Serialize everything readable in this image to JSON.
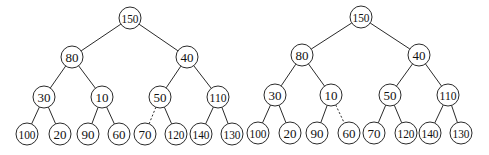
{
  "diagram": {
    "type": "binary-tree-pair",
    "node_radius": 11,
    "trees": [
      {
        "id": "left-tree",
        "nodes": [
          {
            "id": "L0",
            "label": "150",
            "x": 130,
            "y": 18
          },
          {
            "id": "L1",
            "label": "80",
            "x": 72,
            "y": 57
          },
          {
            "id": "L2",
            "label": "40",
            "x": 187,
            "y": 57
          },
          {
            "id": "L3",
            "label": "30",
            "x": 44,
            "y": 97
          },
          {
            "id": "L4",
            "label": "10",
            "x": 102,
            "y": 97
          },
          {
            "id": "L5",
            "label": "50",
            "x": 160,
            "y": 97
          },
          {
            "id": "L6",
            "label": "110",
            "x": 218,
            "y": 97
          },
          {
            "id": "L7",
            "label": "100",
            "x": 27,
            "y": 134
          },
          {
            "id": "L8",
            "label": "20",
            "x": 60,
            "y": 134
          },
          {
            "id": "L9",
            "label": "90",
            "x": 88,
            "y": 134
          },
          {
            "id": "L10",
            "label": "60",
            "x": 119,
            "y": 134
          },
          {
            "id": "L11",
            "label": "70",
            "x": 145,
            "y": 134
          },
          {
            "id": "L12",
            "label": "120",
            "x": 176,
            "y": 134
          },
          {
            "id": "L13",
            "label": "140",
            "x": 201,
            "y": 134
          },
          {
            "id": "L14",
            "label": "130",
            "x": 232,
            "y": 134
          }
        ],
        "edges": [
          {
            "from": "L0",
            "to": "L1",
            "style": "solid"
          },
          {
            "from": "L0",
            "to": "L2",
            "style": "solid"
          },
          {
            "from": "L1",
            "to": "L3",
            "style": "solid"
          },
          {
            "from": "L1",
            "to": "L4",
            "style": "solid"
          },
          {
            "from": "L2",
            "to": "L5",
            "style": "solid"
          },
          {
            "from": "L2",
            "to": "L6",
            "style": "solid"
          },
          {
            "from": "L3",
            "to": "L7",
            "style": "solid"
          },
          {
            "from": "L3",
            "to": "L8",
            "style": "solid"
          },
          {
            "from": "L4",
            "to": "L9",
            "style": "solid"
          },
          {
            "from": "L4",
            "to": "L10",
            "style": "solid"
          },
          {
            "from": "L5",
            "to": "L11",
            "style": "dashed"
          },
          {
            "from": "L5",
            "to": "L12",
            "style": "solid"
          },
          {
            "from": "L6",
            "to": "L13",
            "style": "solid"
          },
          {
            "from": "L6",
            "to": "L14",
            "style": "solid"
          }
        ]
      },
      {
        "id": "right-tree",
        "nodes": [
          {
            "id": "R0",
            "label": "150",
            "x": 361,
            "y": 17
          },
          {
            "id": "R1",
            "label": "80",
            "x": 302,
            "y": 55
          },
          {
            "id": "R2",
            "label": "40",
            "x": 419,
            "y": 55
          },
          {
            "id": "R3",
            "label": "30",
            "x": 275,
            "y": 95
          },
          {
            "id": "R4",
            "label": "10",
            "x": 331,
            "y": 95
          },
          {
            "id": "R5",
            "label": "50",
            "x": 390,
            "y": 95
          },
          {
            "id": "R6",
            "label": "110",
            "x": 448,
            "y": 95
          },
          {
            "id": "R7",
            "label": "100",
            "x": 258,
            "y": 133
          },
          {
            "id": "R8",
            "label": "20",
            "x": 290,
            "y": 133
          },
          {
            "id": "R9",
            "label": "90",
            "x": 317,
            "y": 133
          },
          {
            "id": "R10",
            "label": "60",
            "x": 349,
            "y": 133
          },
          {
            "id": "R11",
            "label": "70",
            "x": 374,
            "y": 133
          },
          {
            "id": "R12",
            "label": "120",
            "x": 406,
            "y": 133
          },
          {
            "id": "R13",
            "label": "140",
            "x": 430,
            "y": 133
          },
          {
            "id": "R14",
            "label": "130",
            "x": 461,
            "y": 133
          }
        ],
        "edges": [
          {
            "from": "R0",
            "to": "R1",
            "style": "solid"
          },
          {
            "from": "R0",
            "to": "R2",
            "style": "solid"
          },
          {
            "from": "R1",
            "to": "R3",
            "style": "solid"
          },
          {
            "from": "R1",
            "to": "R4",
            "style": "solid"
          },
          {
            "from": "R2",
            "to": "R5",
            "style": "solid"
          },
          {
            "from": "R2",
            "to": "R6",
            "style": "solid"
          },
          {
            "from": "R3",
            "to": "R7",
            "style": "solid"
          },
          {
            "from": "R3",
            "to": "R8",
            "style": "solid"
          },
          {
            "from": "R4",
            "to": "R9",
            "style": "solid"
          },
          {
            "from": "R4",
            "to": "R10",
            "style": "dashed"
          },
          {
            "from": "R5",
            "to": "R11",
            "style": "solid"
          },
          {
            "from": "R5",
            "to": "R12",
            "style": "solid"
          },
          {
            "from": "R6",
            "to": "R13",
            "style": "solid"
          },
          {
            "from": "R6",
            "to": "R14",
            "style": "solid"
          }
        ]
      }
    ]
  }
}
